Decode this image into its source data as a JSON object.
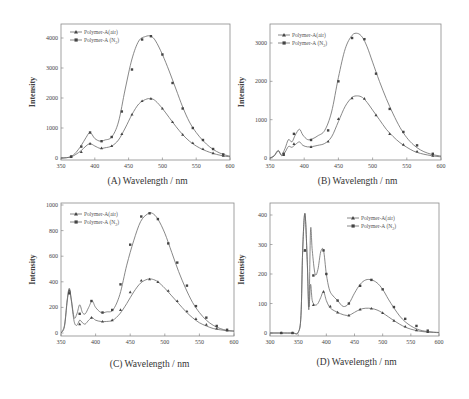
{
  "chart_data": [
    {
      "id": "A",
      "type": "line",
      "panel_label": "(A)",
      "xlabel": "Wavelength / nm",
      "ylabel": "Intensity",
      "xlim": [
        350,
        600
      ],
      "ylim": [
        0,
        4400
      ],
      "xticks": [
        350,
        400,
        450,
        500,
        550,
        600
      ],
      "yticks": [
        0,
        1000,
        2000,
        3000,
        4000
      ],
      "legend": [
        "Polymer-A(air)",
        "Polymer-A (N2)"
      ],
      "legend_position": "top-left",
      "series": [
        {
          "name": "Polymer-A(air)",
          "marker": "triangle",
          "x": [
            350,
            358,
            365,
            372,
            380,
            387,
            393,
            400,
            408,
            415,
            425,
            435,
            445,
            455,
            465,
            475,
            483,
            490,
            500,
            510,
            520,
            530,
            540,
            550,
            560,
            570,
            580,
            590,
            600
          ],
          "y": [
            0,
            10,
            40,
            120,
            250,
            400,
            480,
            400,
            320,
            340,
            400,
            600,
            1000,
            1450,
            1800,
            1950,
            1980,
            1900,
            1650,
            1350,
            1050,
            780,
            560,
            400,
            280,
            190,
            120,
            70,
            40
          ],
          "markers_x": [
            365,
            380,
            393,
            410,
            425,
            440,
            455,
            470,
            483,
            500,
            515,
            530,
            545,
            560,
            575,
            590
          ],
          "markers_y": [
            40,
            200,
            480,
            330,
            400,
            800,
            1450,
            1900,
            1980,
            1650,
            1200,
            780,
            500,
            300,
            160,
            80
          ]
        },
        {
          "name": "Polymer-A (N2)",
          "marker": "square",
          "x": [
            350,
            358,
            365,
            372,
            380,
            387,
            393,
            400,
            408,
            415,
            425,
            435,
            445,
            455,
            465,
            475,
            483,
            490,
            500,
            510,
            520,
            530,
            540,
            550,
            560,
            570,
            580,
            590,
            600
          ],
          "y": [
            0,
            10,
            50,
            180,
            420,
            680,
            850,
            650,
            560,
            600,
            700,
            1200,
            2300,
            3300,
            3900,
            4050,
            4060,
            3900,
            3450,
            2900,
            2300,
            1700,
            1200,
            850,
            580,
            370,
            220,
            120,
            60
          ],
          "markers_x": [
            365,
            380,
            393,
            410,
            425,
            440,
            455,
            470,
            483,
            500,
            515,
            530,
            545,
            560,
            575,
            590
          ],
          "markers_y": [
            50,
            380,
            850,
            560,
            700,
            1550,
            2950,
            3950,
            4060,
            3450,
            2500,
            1650,
            1000,
            600,
            300,
            120
          ]
        }
      ]
    },
    {
      "id": "B",
      "type": "line",
      "panel_label": "(B)",
      "xlabel": "Wavelength / nm",
      "ylabel": "Intensity",
      "xlim": [
        350,
        600
      ],
      "ylim": [
        0,
        3400
      ],
      "xticks": [
        350,
        400,
        450,
        500,
        550,
        600
      ],
      "yticks": [
        0,
        1000,
        2000,
        3000
      ],
      "legend": [
        "Polymer-A(air)",
        "Polymer-A (N2)"
      ],
      "legend_position": "top-left",
      "series": [
        {
          "name": "Polymer-A(air)",
          "marker": "triangle",
          "x": [
            350,
            356,
            362,
            367,
            372,
            377,
            382,
            387,
            393,
            398,
            405,
            412,
            420,
            430,
            440,
            450,
            460,
            470,
            478,
            485,
            492,
            500,
            510,
            520,
            530,
            540,
            550,
            560,
            570,
            580,
            590,
            600
          ],
          "y": [
            0,
            50,
            180,
            60,
            150,
            300,
            280,
            350,
            420,
            330,
            290,
            300,
            330,
            380,
            550,
            950,
            1350,
            1580,
            1620,
            1580,
            1450,
            1250,
            1000,
            750,
            560,
            400,
            280,
            180,
            120,
            80,
            50,
            30
          ],
          "markers_x": [
            370,
            385,
            410,
            435,
            450,
            470,
            488,
            505,
            525,
            545,
            565,
            588
          ],
          "markers_y": [
            80,
            370,
            290,
            430,
            1020,
            1560,
            1550,
            1120,
            630,
            350,
            170,
            60
          ]
        },
        {
          "name": "Polymer-A (N2)",
          "marker": "square",
          "x": [
            350,
            356,
            362,
            367,
            372,
            377,
            382,
            387,
            393,
            398,
            405,
            412,
            420,
            430,
            440,
            450,
            460,
            470,
            478,
            485,
            492,
            500,
            510,
            520,
            530,
            540,
            550,
            560,
            570,
            580,
            590,
            600
          ],
          "y": [
            0,
            60,
            200,
            80,
            250,
            480,
            420,
            600,
            750,
            600,
            480,
            500,
            580,
            720,
            1200,
            2100,
            2850,
            3200,
            3250,
            3150,
            2900,
            2500,
            2000,
            1550,
            1150,
            800,
            530,
            340,
            210,
            130,
            80,
            50
          ],
          "markers_x": [
            370,
            385,
            410,
            435,
            450,
            470,
            488,
            505,
            525,
            545,
            565,
            588
          ],
          "markers_y": [
            110,
            630,
            470,
            720,
            2000,
            3130,
            3100,
            2200,
            1280,
            680,
            330,
            110
          ]
        }
      ]
    },
    {
      "id": "C",
      "type": "line",
      "panel_label": "(C)",
      "xlabel": "Wavelength / nm",
      "ylabel": "Intensity",
      "xlim": [
        350,
        600
      ],
      "ylim": [
        0,
        1000
      ],
      "xticks": [
        350,
        400,
        450,
        500,
        550,
        600
      ],
      "yticks": [
        0,
        200,
        400,
        600,
        800,
        1000
      ],
      "legend": [
        "Polymer-A(air)",
        "Polymer-A (N2)"
      ],
      "legend_position": "top-left",
      "series": [
        {
          "name": "Polymer-A(air)",
          "marker": "triangle",
          "x": [
            350,
            355,
            359,
            362,
            365,
            369,
            373,
            377,
            381,
            385,
            390,
            395,
            400,
            408,
            416,
            425,
            435,
            445,
            455,
            465,
            475,
            482,
            490,
            500,
            510,
            520,
            530,
            540,
            550,
            560,
            570,
            580,
            590,
            600
          ],
          "y": [
            0,
            50,
            250,
            340,
            250,
            90,
            60,
            100,
            80,
            70,
            100,
            120,
            100,
            90,
            90,
            100,
            150,
            230,
            320,
            390,
            420,
            420,
            400,
            350,
            290,
            230,
            170,
            120,
            80,
            55,
            35,
            25,
            18,
            15
          ],
          "markers_x": [
            362,
            377,
            394,
            410,
            424,
            436,
            450,
            466,
            478,
            490,
            505,
            518,
            532,
            545,
            560,
            575,
            590
          ],
          "markers_y": [
            330,
            70,
            120,
            90,
            100,
            180,
            320,
            410,
            420,
            400,
            330,
            250,
            170,
            110,
            65,
            35,
            20
          ]
        },
        {
          "name": "Polymer-A (N2)",
          "marker": "square",
          "x": [
            350,
            355,
            359,
            362,
            365,
            369,
            373,
            377,
            381,
            385,
            390,
            395,
            400,
            408,
            416,
            425,
            435,
            445,
            455,
            465,
            475,
            482,
            490,
            500,
            510,
            520,
            530,
            540,
            550,
            560,
            570,
            580,
            590,
            600
          ],
          "y": [
            0,
            60,
            260,
            350,
            260,
            120,
            150,
            220,
            160,
            150,
            200,
            250,
            200,
            160,
            165,
            180,
            300,
            530,
            720,
            870,
            930,
            935,
            890,
            780,
            630,
            480,
            350,
            240,
            160,
            100,
            60,
            35,
            20,
            15
          ],
          "markers_x": [
            362,
            377,
            394,
            410,
            424,
            436,
            450,
            466,
            478,
            490,
            505,
            518,
            532,
            545,
            560,
            575,
            590
          ],
          "markers_y": [
            310,
            150,
            250,
            160,
            180,
            380,
            690,
            910,
            935,
            890,
            700,
            550,
            370,
            210,
            120,
            55,
            25
          ]
        }
      ]
    },
    {
      "id": "D",
      "type": "line",
      "panel_label": "(D)",
      "xlabel": "Wavelength / nm",
      "ylabel": "Intensity",
      "xlim": [
        300,
        600
      ],
      "ylim": [
        -20,
        440
      ],
      "xticks": [
        300,
        350,
        400,
        450,
        500,
        550,
        600
      ],
      "yticks": [
        0,
        100,
        200,
        300,
        400
      ],
      "legend": [
        "Polymer-A(air)",
        "Polymer-A (N2)"
      ],
      "legend_position": "top-right",
      "series": [
        {
          "name": "Polymer-A(air)",
          "marker": "triangle",
          "x": [
            300,
            320,
            340,
            350,
            355,
            358,
            362,
            366,
            369,
            372,
            375,
            380,
            385,
            390,
            395,
            400,
            405,
            410,
            420,
            430,
            440,
            450,
            460,
            470,
            480,
            490,
            500,
            510,
            520,
            530,
            540,
            550,
            560,
            570,
            580,
            590,
            600
          ],
          "y": [
            0,
            0,
            0,
            2,
            60,
            280,
            405,
            250,
            90,
            165,
            110,
            95,
            100,
            120,
            140,
            110,
            90,
            80,
            70,
            62,
            60,
            70,
            80,
            84,
            83,
            78,
            68,
            55,
            42,
            30,
            20,
            13,
            8,
            5,
            3,
            2,
            1
          ],
          "markers_x": [
            320,
            340,
            362,
            377,
            395,
            407,
            420,
            440,
            460,
            480,
            500,
            520,
            540,
            560,
            580
          ],
          "markers_y": [
            0,
            0,
            280,
            95,
            140,
            90,
            70,
            60,
            80,
            83,
            68,
            42,
            22,
            10,
            4
          ]
        },
        {
          "name": "Polymer-A (N2)",
          "marker": "square",
          "x": [
            300,
            320,
            340,
            350,
            355,
            358,
            362,
            366,
            369,
            372,
            375,
            380,
            385,
            390,
            395,
            400,
            405,
            410,
            420,
            430,
            440,
            450,
            460,
            470,
            480,
            490,
            500,
            510,
            520,
            530,
            540,
            550,
            560,
            570,
            580,
            590,
            600
          ],
          "y": [
            0,
            0,
            0,
            2,
            60,
            280,
            405,
            250,
            80,
            350,
            280,
            200,
            215,
            275,
            280,
            200,
            150,
            130,
            110,
            90,
            100,
            135,
            165,
            180,
            180,
            170,
            148,
            115,
            85,
            58,
            38,
            24,
            14,
            8,
            5,
            3,
            2
          ],
          "markers_x": [
            320,
            340,
            362,
            377,
            395,
            400,
            420,
            440,
            460,
            480,
            500,
            520,
            540,
            560,
            580
          ],
          "markers_y": [
            0,
            0,
            280,
            195,
            280,
            200,
            110,
            100,
            160,
            180,
            148,
            88,
            48,
            24,
            8
          ]
        }
      ]
    }
  ],
  "ui": {
    "legend_air": "Polymer-A(air)",
    "legend_n2_prefix": "Polymer-A (N",
    "legend_n2_sub": "2",
    "legend_n2_suffix": ")",
    "ylabel": "Intensity",
    "xlabel": "Wavelength / nm",
    "panel_A": "(A)",
    "panel_B": "(B)",
    "panel_C": "(C)",
    "panel_D": "(D)"
  },
  "colors": {
    "curve": "#6a6a6a",
    "marker": "#444444",
    "frame": "#8a8a8a",
    "text": "#333333"
  }
}
